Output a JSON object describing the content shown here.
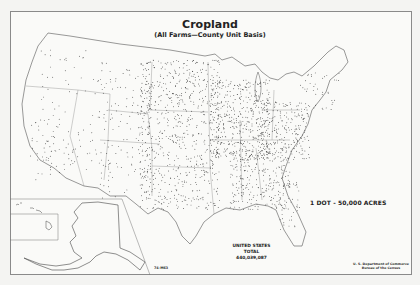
{
  "map": {
    "title": "Cropland",
    "subtitle": "(All Farms—County Unit Basis)",
    "legend": "1 DOT - 50,000 ACRES",
    "total": {
      "line1": "UNITED STATES",
      "line2": "TOTAL",
      "value": "440,039,087"
    },
    "source": {
      "line1": "U. S. Department of Commerce",
      "line2": "Bureau of the Census"
    },
    "map_number": "74-M63",
    "insets": [
      "Alaska",
      "Hawaii"
    ],
    "colors": {
      "dot": "#1a1a1a",
      "outline": "#555555",
      "background": "#fafaf8"
    }
  }
}
